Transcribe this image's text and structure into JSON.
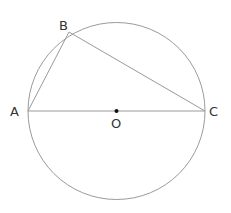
{
  "diagram": {
    "type": "geometry",
    "colors": {
      "stroke": "#9a9a9a",
      "label": "#333333",
      "center_dot": "#111111",
      "background": "#ffffff"
    },
    "circle": {
      "center": "O",
      "cx": 116.5,
      "cy": 111,
      "r": 88.5
    },
    "points": [
      {
        "name": "A",
        "x": 28,
        "y": 111,
        "label": "A",
        "label_x": 10,
        "label_y": 116
      },
      {
        "name": "B",
        "x": 69,
        "y": 32,
        "label": "B",
        "label_x": 59,
        "label_y": 30
      },
      {
        "name": "C",
        "x": 205,
        "y": 111,
        "label": "C",
        "label_x": 209,
        "label_y": 116
      },
      {
        "name": "O",
        "x": 116.5,
        "y": 111,
        "label": "O",
        "label_x": 111,
        "label_y": 128
      }
    ],
    "segments": [
      {
        "from": "A",
        "to": "B"
      },
      {
        "from": "B",
        "to": "C"
      },
      {
        "from": "A",
        "to": "C"
      }
    ],
    "labels": {
      "A": "A",
      "B": "B",
      "C": "C",
      "O": "O"
    }
  }
}
